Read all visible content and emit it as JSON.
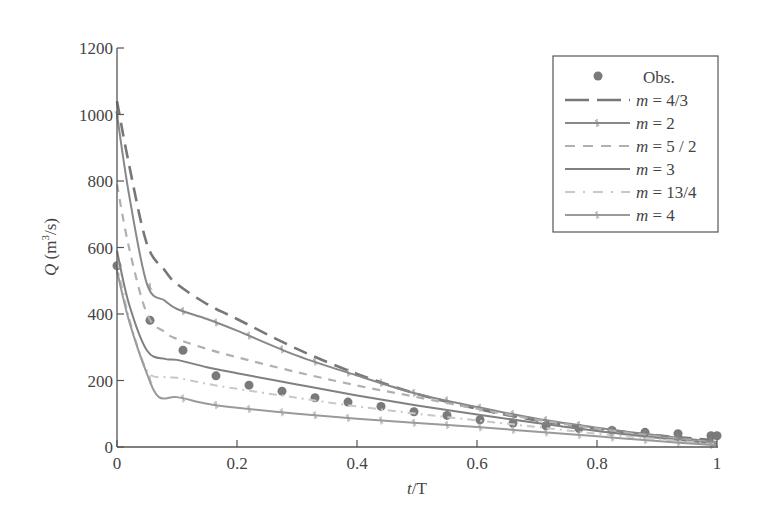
{
  "chart_data": {
    "type": "line",
    "title": "",
    "xlabel": "t/T",
    "ylabel": "Q (m³/s)",
    "xlim": [
      0,
      1
    ],
    "ylim": [
      0,
      1200
    ],
    "xticks": [
      0,
      0.2,
      0.4,
      0.6,
      0.8,
      1
    ],
    "xtick_labels": [
      "0",
      "0.2",
      "0.4",
      "0.6",
      "0.8",
      "1"
    ],
    "yticks": [
      0,
      200,
      400,
      600,
      800,
      1000,
      1200
    ],
    "ytick_labels": [
      "0",
      "200",
      "400",
      "600",
      "800",
      "1000",
      "1200"
    ],
    "grid": false,
    "legend_position": "upper right",
    "series": [
      {
        "name": "Obs.",
        "style": "markers",
        "color": "#7a7a7a",
        "x": [
          0,
          0.055,
          0.11,
          0.165,
          0.22,
          0.275,
          0.33,
          0.385,
          0.44,
          0.495,
          0.55,
          0.605,
          0.66,
          0.715,
          0.77,
          0.825,
          0.88,
          0.935,
          0.99,
          1.0
        ],
        "y": [
          545,
          381,
          291,
          214,
          186,
          168,
          148,
          135,
          122,
          106,
          95,
          82,
          72,
          64,
          56,
          50,
          44,
          40,
          34,
          34
        ]
      },
      {
        "name": "m = 4/3",
        "style": "longdash",
        "color": "#777777",
        "x": [
          0,
          0.02,
          0.05,
          0.08,
          0.1,
          0.15,
          0.2,
          0.3,
          0.4,
          0.5,
          0.6,
          0.7,
          0.8,
          0.9,
          1.0
        ],
        "y": [
          1040,
          850,
          610,
          530,
          490,
          430,
          385,
          295,
          220,
          160,
          115,
          80,
          55,
          35,
          20
        ]
      },
      {
        "name": "m = 2",
        "style": "cross",
        "color": "#888888",
        "x": [
          0,
          0.02,
          0.05,
          0.08,
          0.1,
          0.15,
          0.2,
          0.3,
          0.4,
          0.5,
          0.6,
          0.7,
          0.8,
          0.9,
          1.0
        ],
        "y": [
          1000,
          760,
          490,
          440,
          415,
          385,
          350,
          275,
          215,
          160,
          120,
          85,
          58,
          35,
          15
        ]
      },
      {
        "name": "m = 5/2",
        "style": "dash",
        "color": "#b0b0b0",
        "x": [
          0,
          0.02,
          0.05,
          0.08,
          0.1,
          0.15,
          0.2,
          0.3,
          0.4,
          0.5,
          0.6,
          0.7,
          0.8,
          0.9,
          1.0
        ],
        "y": [
          790,
          600,
          400,
          345,
          325,
          295,
          270,
          225,
          185,
          150,
          115,
          82,
          55,
          32,
          12
        ]
      },
      {
        "name": "m = 3",
        "style": "solid",
        "color": "#808080",
        "x": [
          0,
          0.02,
          0.05,
          0.08,
          0.1,
          0.15,
          0.2,
          0.3,
          0.4,
          0.5,
          0.6,
          0.7,
          0.8,
          0.9,
          1.0
        ],
        "y": [
          590,
          430,
          290,
          265,
          262,
          240,
          222,
          188,
          155,
          125,
          98,
          72,
          48,
          28,
          10
        ]
      },
      {
        "name": "m = 13/4",
        "style": "dashdot",
        "color": "#c8c8c8",
        "x": [
          0,
          0.02,
          0.05,
          0.08,
          0.1,
          0.15,
          0.2,
          0.3,
          0.4,
          0.5,
          0.6,
          0.7,
          0.8,
          0.9,
          1.0
        ],
        "y": [
          560,
          390,
          230,
          210,
          208,
          190,
          175,
          148,
          122,
          100,
          80,
          60,
          40,
          24,
          8
        ]
      },
      {
        "name": "m = 4",
        "style": "cross",
        "color": "#9a9a9a",
        "x": [
          0,
          0.02,
          0.05,
          0.07,
          0.1,
          0.15,
          0.2,
          0.3,
          0.4,
          0.5,
          0.6,
          0.7,
          0.8,
          0.9,
          1.0
        ],
        "y": [
          530,
          380,
          220,
          150,
          150,
          130,
          118,
          100,
          85,
          72,
          60,
          46,
          32,
          18,
          5
        ]
      }
    ]
  },
  "legend": {
    "items": [
      {
        "label": "Obs.",
        "prefix": "",
        "eq": "Obs."
      },
      {
        "label": "m = 4/3",
        "prefix": "m",
        "eq": " = 4/3"
      },
      {
        "label": "m = 2",
        "prefix": "m",
        "eq": " = 2"
      },
      {
        "label": "m = 5 / 2",
        "prefix": "m",
        "eq": " = 5 / 2"
      },
      {
        "label": "m = 3",
        "prefix": "m",
        "eq": " = 3"
      },
      {
        "label": "m = 13/4",
        "prefix": "m",
        "eq": " = 13/4"
      },
      {
        "label": "m = 4",
        "prefix": "m",
        "eq": " = 4"
      }
    ]
  },
  "axes": {
    "xlabel_t": "t",
    "xlabel_rest": "/T",
    "ylabel_q": "Q",
    "ylabel_units": " (m",
    "ylabel_sup": "3",
    "ylabel_end": "/s)"
  }
}
